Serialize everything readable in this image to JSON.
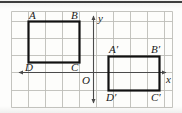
{
  "figure": {
    "kind": "coordinate-grid-geometry-diagram",
    "background_color": "#fdfdfb",
    "grid_color": "#b9b9b4",
    "axis_color": "#4a4a4a",
    "shape_color": "#111111",
    "label_color": "#1a1a1a",
    "top_rule_color": "#3a3a3a",
    "grid": {
      "cell_size": 17,
      "columns": 9,
      "rows": 5,
      "origin_cell_x": 5,
      "origin_cell_y": 3
    },
    "axes": [
      {
        "name": "x-axis",
        "label": "x",
        "orientation": "horizontal",
        "arrows": "both"
      },
      {
        "name": "y-axis",
        "label": "y",
        "orientation": "vertical",
        "arrows": "both"
      }
    ],
    "axis_labels": {
      "x": "x",
      "y": "y",
      "origin": "O"
    },
    "shapes": [
      {
        "name": "rectangle-ABCD",
        "vertices": [
          {
            "label": "A",
            "grid_x": 1,
            "grid_y": 0.6
          },
          {
            "label": "B",
            "grid_x": 4,
            "grid_y": 0.6
          },
          {
            "label": "C",
            "grid_x": 4,
            "grid_y": 3.0
          },
          {
            "label": "D",
            "grid_x": 1,
            "grid_y": 3.0
          }
        ],
        "label_positions": {
          "A": "top-left-outside",
          "B": "top-right-outside",
          "C": "bottom-right-outside",
          "D": "bottom-left-outside"
        }
      },
      {
        "name": "rectangle-A-prime-B-prime-C-prime-D-prime",
        "vertices": [
          {
            "label": "A'",
            "grid_x": 5.7,
            "grid_y": 2.65
          },
          {
            "label": "B'",
            "grid_x": 8.7,
            "grid_y": 2.65
          },
          {
            "label": "C'",
            "grid_x": 8.7,
            "grid_y": 4.65
          },
          {
            "label": "D'",
            "grid_x": 5.7,
            "grid_y": 4.65
          }
        ],
        "label_positions": {
          "A'": "top-left-outside",
          "B'": "top-right-outside",
          "C'": "bottom-right-outside",
          "D'": "bottom-left-outside"
        }
      }
    ],
    "vertex_labels": {
      "A": "A",
      "B": "B",
      "C": "C",
      "D": "D",
      "A_prime": "A′",
      "B_prime": "B′",
      "C_prime": "C′",
      "D_prime": "D′"
    }
  }
}
